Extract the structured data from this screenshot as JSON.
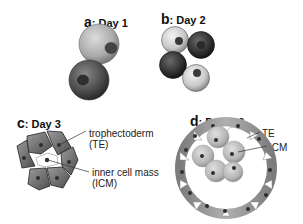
{
  "panels": [
    {
      "letter": "a",
      "title": ": Day 1",
      "stage": "2-cell"
    },
    {
      "letter": "b",
      "title": ": Day 2",
      "stage": "4-cell"
    },
    {
      "letter": "c",
      "title": ": Day 3",
      "stage": "morula",
      "labels": {
        "te_line1": "trophectoderm",
        "te_line2": "(TE)",
        "icm_line1": "inner cell mass",
        "icm_line2": "(ICM)"
      }
    },
    {
      "letter": "d",
      "title": ": Day 4-6",
      "stage": "blastocyst",
      "labels": {
        "te": "TE",
        "icm": "ICM"
      }
    }
  ],
  "colors": {
    "light_cell": "#b8b8b8",
    "dark_cell": "#555555",
    "nucleus": "#333333",
    "te_cell": "#8a8a8a",
    "icm_cell": "#c4c4c4"
  }
}
